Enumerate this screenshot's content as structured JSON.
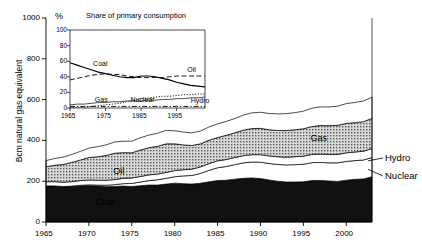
{
  "chart_data": [
    {
      "id": "main",
      "type": "area",
      "stacked": true,
      "title": "",
      "xlabel": "",
      "ylabel": "Bcm natural gas equivalent",
      "xlim": [
        1965,
        2003
      ],
      "ylim": [
        0,
        1000
      ],
      "yticks": [
        0,
        200,
        400,
        600,
        800,
        1000
      ],
      "xticks": [
        1965,
        1970,
        1975,
        1980,
        1985,
        1990,
        1995,
        2000
      ],
      "grid": false,
      "legend": "inline-area-labels",
      "x": [
        1965,
        1966,
        1967,
        1968,
        1969,
        1970,
        1971,
        1972,
        1973,
        1974,
        1975,
        1976,
        1977,
        1978,
        1979,
        1980,
        1981,
        1982,
        1983,
        1984,
        1985,
        1986,
        1987,
        1988,
        1989,
        1990,
        1991,
        1992,
        1993,
        1994,
        1995,
        1996,
        1997,
        1998,
        1999,
        2000,
        2001,
        2002,
        2003
      ],
      "series": [
        {
          "name": "Coal",
          "fill": "#111111",
          "values": [
            176,
            176,
            172,
            174,
            177,
            178,
            176,
            173,
            174,
            176,
            174,
            178,
            181,
            181,
            186,
            190,
            188,
            186,
            190,
            197,
            203,
            205,
            210,
            214,
            216,
            213,
            206,
            200,
            196,
            196,
            197,
            203,
            204,
            201,
            199,
            205,
            209,
            211,
            222
          ]
        },
        {
          "name": "Nuclear",
          "fill": "#ffffff",
          "values": [
            1,
            1,
            2,
            2,
            3,
            4,
            5,
            7,
            9,
            12,
            15,
            18,
            22,
            26,
            28,
            32,
            38,
            42,
            48,
            56,
            63,
            67,
            71,
            76,
            78,
            80,
            81,
            82,
            84,
            85,
            86,
            88,
            88,
            89,
            91,
            92,
            92,
            93,
            94
          ]
        },
        {
          "name": "Hydro",
          "fill": "#ffffff",
          "values": [
            20,
            21,
            21,
            22,
            23,
            24,
            24,
            25,
            25,
            26,
            27,
            27,
            28,
            28,
            29,
            30,
            30,
            31,
            32,
            33,
            34,
            34,
            35,
            35,
            36,
            37,
            37,
            38,
            38,
            39,
            40,
            40,
            41,
            41,
            41,
            42,
            42,
            43,
            44
          ]
        },
        {
          "name": "Oil",
          "fill": "#b8b8b8",
          "hatch": "dots",
          "values": [
            74,
            80,
            87,
            94,
            101,
            110,
            115,
            121,
            129,
            126,
            123,
            130,
            133,
            136,
            140,
            131,
            122,
            116,
            113,
            115,
            114,
            119,
            121,
            125,
            128,
            129,
            128,
            129,
            130,
            132,
            134,
            137,
            140,
            141,
            143,
            144,
            144,
            145,
            148
          ]
        },
        {
          "name": "Gas",
          "fill": "#ffffff",
          "values": [
            30,
            33,
            36,
            39,
            42,
            46,
            49,
            52,
            55,
            56,
            57,
            60,
            62,
            64,
            66,
            64,
            63,
            62,
            63,
            65,
            67,
            68,
            70,
            74,
            77,
            79,
            80,
            81,
            83,
            84,
            86,
            90,
            91,
            92,
            94,
            97,
            99,
            101,
            104
          ]
        }
      ],
      "area_labels": [
        {
          "name": "Gas",
          "year": 1997,
          "value": 405
        },
        {
          "name": "Oil",
          "year": 1974,
          "value": 245
        },
        {
          "name": "Coal",
          "year": 1972,
          "value": 95
        }
      ],
      "side_labels": [
        {
          "name": "Hydro",
          "year": 2003,
          "value": 300
        },
        {
          "name": "Nuclear",
          "year": 2003,
          "value": 258
        }
      ]
    },
    {
      "id": "inset",
      "type": "line",
      "title": "Share of primary consumption",
      "ylabel": "%",
      "xlabel": "",
      "xlim": [
        1965,
        2003
      ],
      "ylim": [
        0,
        100
      ],
      "yticks": [
        0,
        20,
        40,
        60,
        80,
        100
      ],
      "xticks": [
        1965,
        1975,
        1985,
        1995
      ],
      "grid": false,
      "x": [
        1965,
        1967,
        1969,
        1971,
        1973,
        1975,
        1977,
        1979,
        1981,
        1983,
        1985,
        1987,
        1989,
        1991,
        1993,
        1995,
        1997,
        1999,
        2001,
        2003
      ],
      "series": [
        {
          "name": "Coal",
          "style": "solid",
          "values": [
            58,
            55,
            52,
            49,
            46,
            44,
            42,
            40,
            39,
            39,
            41,
            41,
            40,
            38,
            36,
            33,
            31,
            29,
            28,
            27
          ]
        },
        {
          "name": "Oil",
          "style": "dashed",
          "values": [
            36,
            38,
            40,
            42,
            43,
            44,
            43,
            43,
            41,
            40,
            39,
            39,
            39,
            39,
            40,
            41,
            41,
            41,
            41,
            41
          ]
        },
        {
          "name": "Gas",
          "style": "solid-thin",
          "values": [
            4,
            5,
            5,
            6,
            7,
            7,
            8,
            8,
            9,
            9,
            9,
            10,
            10,
            11,
            11,
            12,
            12,
            13,
            13,
            14
          ]
        },
        {
          "name": "Nuclear",
          "style": "dotted",
          "values": [
            0,
            1,
            1,
            2,
            3,
            4,
            5,
            6,
            8,
            10,
            12,
            13,
            14,
            15,
            15,
            16,
            17,
            17,
            18,
            18
          ]
        },
        {
          "name": "Hydro",
          "style": "dash-dot",
          "values": [
            2,
            2,
            2,
            2,
            2,
            2,
            2,
            2,
            2,
            2,
            2,
            2,
            2,
            2,
            2,
            2,
            2,
            2,
            2,
            2
          ]
        }
      ],
      "series_labels": [
        {
          "name": "Coal",
          "year": 1971.5,
          "value": 55
        },
        {
          "name": "Oil",
          "year": 1998,
          "value": 47
        },
        {
          "name": "Gas",
          "year": 1972,
          "value": 9
        },
        {
          "name": "Nuclear",
          "year": 1982,
          "value": 9
        },
        {
          "name": "Hydro",
          "year": 1999,
          "value": 8
        }
      ]
    }
  ]
}
